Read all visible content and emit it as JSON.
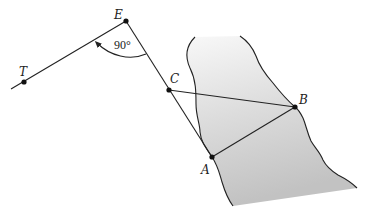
{
  "figure": {
    "type": "geometry-diagram",
    "colors": {
      "line": "#222222",
      "river_top": "#f6f6f6",
      "river_bottom": "#c4c4c4",
      "background": "#ffffff"
    },
    "points": {
      "T": {
        "label": "T",
        "x": 24,
        "y": 82
      },
      "E": {
        "label": "E",
        "x": 126,
        "y": 21
      },
      "C": {
        "label": "C",
        "x": 169,
        "y": 90
      },
      "B": {
        "label": "B",
        "x": 295,
        "y": 107
      },
      "A": {
        "label": "A",
        "x": 212,
        "y": 157
      }
    },
    "angle": {
      "vertex": "E",
      "label": "90°"
    },
    "segments": [
      {
        "from": "T",
        "to": "E"
      },
      {
        "from": "E",
        "to": "A"
      },
      {
        "from": "C",
        "to": "B"
      },
      {
        "from": "A",
        "to": "B"
      }
    ],
    "region": {
      "name": "river",
      "shading": "gradient gray"
    }
  }
}
